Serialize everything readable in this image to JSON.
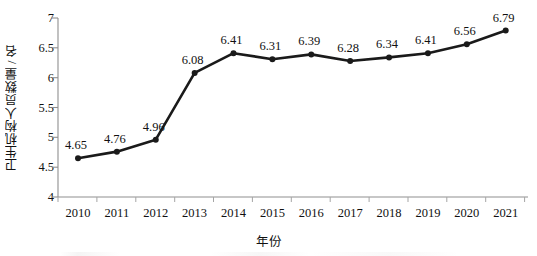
{
  "chart_data": {
    "type": "line",
    "title": "",
    "xlabel": "年份",
    "ylabel": "卫生机构人员数量 / 名",
    "categories": [
      "2010",
      "2011",
      "2012",
      "2013",
      "2014",
      "2015",
      "2016",
      "2017",
      "2018",
      "2019",
      "2020",
      "2021"
    ],
    "values": [
      4.65,
      4.76,
      4.96,
      6.08,
      6.41,
      6.31,
      6.39,
      6.28,
      6.34,
      6.41,
      6.56,
      6.79
    ],
    "point_labels": [
      "4.65",
      "4.76",
      "4.96",
      "6.08",
      "6.41",
      "6.31",
      "6.39",
      "6.28",
      "6.34",
      "6.41",
      "6.56",
      "6.79"
    ],
    "ylim": [
      4,
      7
    ],
    "ytick_labels": [
      "4",
      "4.5",
      "5",
      "5.5",
      "6",
      "6.5",
      "7"
    ],
    "ytick_values": [
      4,
      4.5,
      5,
      5.5,
      6,
      6.5,
      7
    ],
    "grid": false,
    "legend": "none",
    "series_color": "#1a1a1a",
    "marker": "circle",
    "axis_color": "#8a8a8a"
  }
}
